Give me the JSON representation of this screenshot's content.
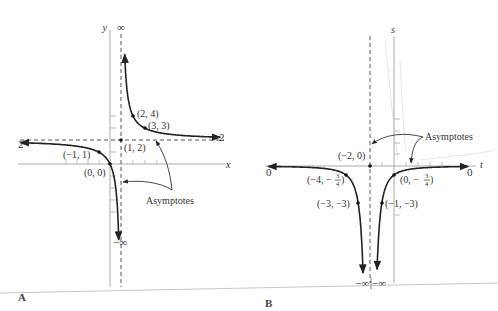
{
  "figure": {
    "panel_a": {
      "label": "A",
      "axis_y_label": "y",
      "axis_x_label": "x",
      "top_infinity": "∞",
      "bottom_infinity": "−∞",
      "left_limit_label": "2",
      "right_limit_label": "2",
      "asymptotes_label": "Asymptotes",
      "points": [
        {
          "label": "(2, 4)"
        },
        {
          "label": "(3, 3)"
        },
        {
          "label": "(1, 2)"
        },
        {
          "label": "(−1, 1)"
        },
        {
          "label": "(0, 0)"
        }
      ]
    },
    "panel_b": {
      "label": "B",
      "axis_s_label": "s",
      "axis_t_label": "t",
      "left_limit_label": "0",
      "right_limit_label": "0",
      "bottom_left_infinity": "−∞",
      "bottom_right_infinity": "−∞",
      "asymptotes_label": "Asymptotes",
      "points": [
        {
          "label": "(−2, 0)"
        },
        {
          "label": "(−4, −"
        },
        {
          "label": "(0, −"
        },
        {
          "label": "(−3, −3)"
        },
        {
          "label": "(−1, −3)"
        }
      ],
      "fraction_num": "3",
      "fraction_den": "4",
      "fraction_close": ")"
    }
  },
  "chart_data": [
    {
      "type": "line",
      "title": "A",
      "function": "y = 2x/(x − 1)",
      "xlabel": "x",
      "ylabel": "y",
      "asymptotes": {
        "vertical": 1,
        "horizontal": 2
      },
      "labeled_points": [
        [
          2,
          4
        ],
        [
          3,
          3
        ],
        [
          1,
          2
        ],
        [
          -1,
          1
        ],
        [
          0,
          0
        ]
      ],
      "limits": {
        "x_to_plus_inf": 2,
        "x_to_minus_inf": 2,
        "x_to_1_plus": "∞",
        "x_to_1_minus": "−∞"
      }
    },
    {
      "type": "line",
      "title": "B",
      "function": "s = −3/(t + 2)^2",
      "xlabel": "t",
      "ylabel": "s",
      "asymptotes": {
        "vertical": -2,
        "horizontal": 0
      },
      "labeled_points": [
        [
          -2,
          0
        ],
        [
          -4,
          -0.75
        ],
        [
          0,
          -0.75
        ],
        [
          -3,
          -3
        ],
        [
          -1,
          -3
        ]
      ],
      "limits": {
        "t_to_plus_inf": 0,
        "t_to_minus_inf": 0,
        "t_to_-2": "−∞"
      }
    }
  ]
}
